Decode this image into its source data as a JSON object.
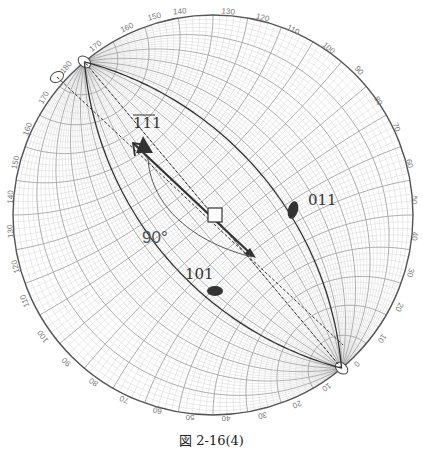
{
  "figure": {
    "caption": "図 2-16(4)",
    "type": "Wulff net stereographic projection",
    "net": {
      "center": [
        213,
        215
      ],
      "radius": 200,
      "rotation_deg": -40,
      "grid_step_deg": 2,
      "major_step_deg": 10
    },
    "poles": [
      {
        "id": "111",
        "label": "111",
        "marker": "triangle",
        "pos": [
          145,
          146
        ],
        "underline": true
      },
      {
        "id": "011",
        "label": "011",
        "marker": "ellipse",
        "pos": [
          293,
          210
        ]
      },
      {
        "id": "101",
        "label": "101",
        "marker": "ellipse",
        "pos": [
          215,
          291
        ]
      },
      {
        "id": "center",
        "label": "",
        "marker": "square",
        "pos": [
          215,
          215
        ]
      }
    ],
    "annotations": {
      "angle_label": "90°",
      "angle_label_pos": [
        160,
        243
      ]
    },
    "outer_scale_labels": [
      {
        "text": "140",
        "x": 180,
        "y": 14,
        "rot": -5
      },
      {
        "text": "130",
        "x": 228,
        "y": 14,
        "rot": 5
      },
      {
        "text": "150",
        "x": 155,
        "y": 19,
        "rot": -15
      },
      {
        "text": "120",
        "x": 262,
        "y": 20,
        "rot": 15
      },
      {
        "text": "160",
        "x": 128,
        "y": 30,
        "rot": -25
      },
      {
        "text": "110",
        "x": 292,
        "y": 32,
        "rot": 28
      },
      {
        "text": "170",
        "x": 97,
        "y": 48,
        "rot": -38
      },
      {
        "text": "100",
        "x": 327,
        "y": 50,
        "rot": 40
      },
      {
        "text": "180",
        "x": 68,
        "y": 69,
        "rot": -50
      },
      {
        "text": "90",
        "x": 357,
        "y": 72,
        "rot": 52
      },
      {
        "text": "170",
        "x": 46,
        "y": 99,
        "rot": -60
      },
      {
        "text": "80",
        "x": 376,
        "y": 102,
        "rot": 60
      },
      {
        "text": "160",
        "x": 30,
        "y": 130,
        "rot": -70
      },
      {
        "text": "70",
        "x": 394,
        "y": 128,
        "rot": 70
      },
      {
        "text": "150",
        "x": 18,
        "y": 163,
        "rot": -78
      },
      {
        "text": "60",
        "x": 407,
        "y": 164,
        "rot": 78
      },
      {
        "text": "140",
        "x": 13,
        "y": 197,
        "rot": -88
      },
      {
        "text": "50",
        "x": 412,
        "y": 200,
        "rot": 90
      },
      {
        "text": "130",
        "x": 13,
        "y": 231,
        "rot": -95
      },
      {
        "text": "40",
        "x": 412,
        "y": 236,
        "rot": 95
      },
      {
        "text": "120",
        "x": 18,
        "y": 266,
        "rot": -105
      },
      {
        "text": "30",
        "x": 408,
        "y": 272,
        "rot": 105
      },
      {
        "text": "110",
        "x": 27,
        "y": 300,
        "rot": -112
      },
      {
        "text": "20",
        "x": 397,
        "y": 306,
        "rot": 115
      },
      {
        "text": "100",
        "x": 45,
        "y": 335,
        "rot": -125
      },
      {
        "text": "10",
        "x": 380,
        "y": 337,
        "rot": 125
      },
      {
        "text": "90",
        "x": 68,
        "y": 360,
        "rot": -135
      },
      {
        "text": "0",
        "x": 355,
        "y": 362,
        "rot": 135
      },
      {
        "text": "80",
        "x": 95,
        "y": 380,
        "rot": -145
      },
      {
        "text": "10",
        "x": 325,
        "y": 385,
        "rot": 145
      },
      {
        "text": "70",
        "x": 125,
        "y": 397,
        "rot": -158
      },
      {
        "text": "20",
        "x": 296,
        "y": 402,
        "rot": 158
      },
      {
        "text": "60",
        "x": 158,
        "y": 408,
        "rot": -168
      },
      {
        "text": "30",
        "x": 262,
        "y": 413,
        "rot": 168
      },
      {
        "text": "50",
        "x": 190,
        "y": 415,
        "rot": 180
      },
      {
        "text": "40",
        "x": 226,
        "y": 416,
        "rot": 180
      }
    ]
  }
}
